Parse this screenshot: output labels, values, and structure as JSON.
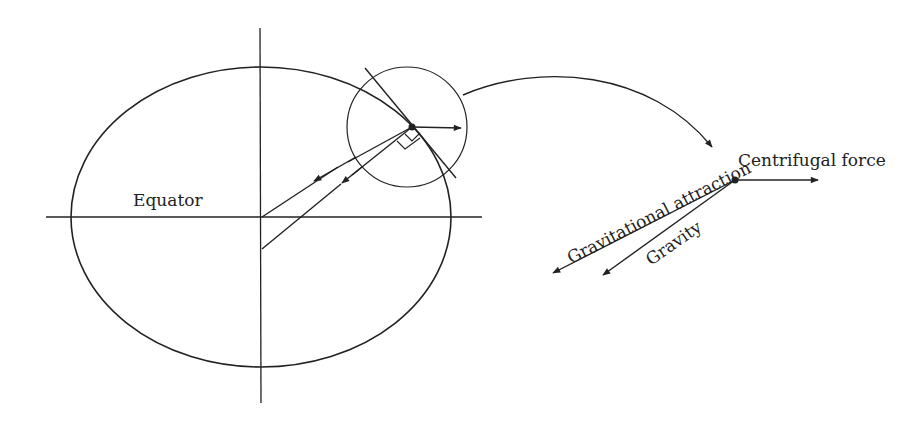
{
  "diagram": {
    "type": "physics-figure",
    "labels": {
      "equator": "Equator",
      "centrifugal": "Centrifugal force",
      "gravitational": "Gravitational attraction",
      "gravity": "Gravity"
    },
    "colors": {
      "line": "#222222",
      "background": "#ffffff"
    }
  }
}
